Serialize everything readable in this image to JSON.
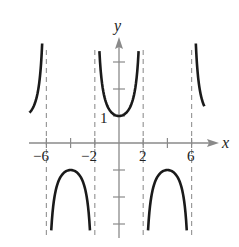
{
  "chart_data": {
    "type": "line",
    "title": "",
    "function": "y = sec(pi*x/4)",
    "xlabel": "x",
    "ylabel": "y",
    "xlim": [
      -7.5,
      7.5
    ],
    "ylim": [
      -3.5,
      3.7
    ],
    "grid": false,
    "x_tick_labels": [
      {
        "value": -6,
        "label": "−6"
      },
      {
        "value": -2,
        "label": "−2"
      },
      {
        "value": 2,
        "label": "2"
      },
      {
        "value": 6,
        "label": "6"
      }
    ],
    "x_ticks": [
      -6,
      -4,
      -2,
      2,
      4,
      6
    ],
    "y_tick_labels": [
      {
        "value": 1,
        "label": "1"
      }
    ],
    "y_ticks": [
      -3,
      -2,
      -1,
      1,
      2,
      3
    ],
    "vertical_asymptotes": [
      -6,
      -2,
      2,
      6
    ],
    "series": [
      {
        "name": "branch-left-upper",
        "x_range": [
          -7.4,
          -6.35
        ],
        "sign": 1
      },
      {
        "name": "branch-center-upper",
        "x_range": [
          -1.62,
          1.62
        ],
        "sign": 1,
        "min_point": [
          0,
          1
        ]
      },
      {
        "name": "branch-right-upper",
        "x_range": [
          6.35,
          7.05
        ],
        "sign": 1
      },
      {
        "name": "branch-left-lower",
        "x_range": [
          -5.6,
          -2.4
        ],
        "sign": -1,
        "max_point": [
          -4,
          -1
        ]
      },
      {
        "name": "branch-right-lower",
        "x_range": [
          2.4,
          5.6
        ],
        "sign": -1,
        "max_point": [
          4,
          -1
        ]
      }
    ]
  },
  "labels": {
    "x_axis": "x",
    "y_axis": "y",
    "x_neg6": "−6",
    "x_neg2": "−2",
    "x_2": "2",
    "x_6": "6",
    "y_1": "1"
  },
  "colors": {
    "curve": "#1a1a1a",
    "axis": "#8a8a8a",
    "asymptote": "#9a9a9a"
  }
}
